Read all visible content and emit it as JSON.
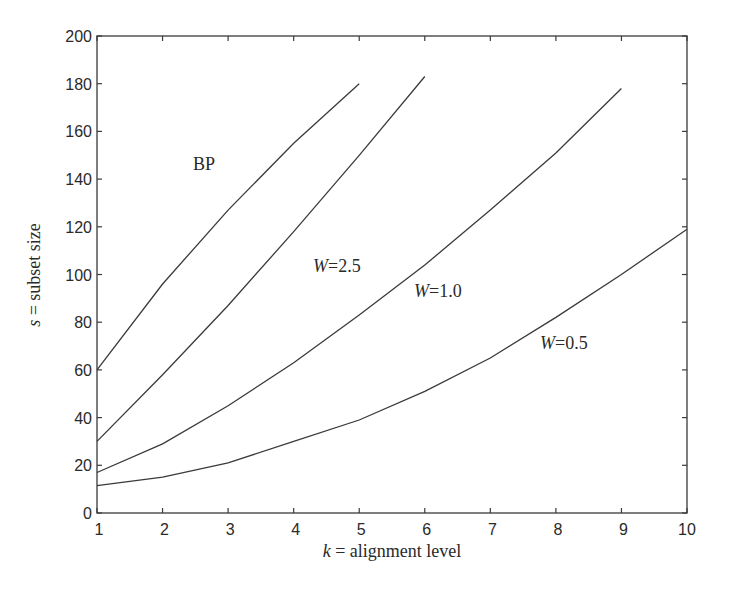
{
  "chart_data": {
    "type": "line",
    "title": "",
    "xlabel_var": "k",
    "xlabel_rest": " = alignment level",
    "xlabel": "k = alignment level",
    "ylabel_var": "s",
    "ylabel_rest": " = subset size",
    "ylabel": "s = subset size",
    "xlim": [
      1,
      10
    ],
    "ylim": [
      0,
      200
    ],
    "xticks": [
      1,
      2,
      3,
      4,
      5,
      6,
      7,
      8,
      9,
      10
    ],
    "yticks": [
      0,
      20,
      40,
      60,
      80,
      100,
      120,
      140,
      160,
      180,
      200
    ],
    "grid": false,
    "legend": "inline labels",
    "series": [
      {
        "name": "BP",
        "label_var": "",
        "label_text": "BP",
        "x": [
          1,
          2,
          3,
          4,
          5
        ],
        "values": [
          60,
          96,
          127,
          155,
          180
        ],
        "label_pos": [
          193,
          170
        ]
      },
      {
        "name": "W=2.5",
        "label_var": "W",
        "label_text": "=2.5",
        "x": [
          1,
          2,
          3,
          4,
          5,
          6
        ],
        "values": [
          30,
          58,
          87,
          118,
          150,
          183
        ],
        "label_pos": [
          313,
          272
        ]
      },
      {
        "name": "W=1.0",
        "label_var": "W",
        "label_text": "=1.0",
        "x": [
          1,
          2,
          3,
          4,
          5,
          6,
          7,
          8,
          9
        ],
        "values": [
          17,
          29,
          45,
          63,
          83,
          104,
          127,
          151,
          178
        ],
        "label_pos": [
          414,
          297
        ]
      },
      {
        "name": "W=0.5",
        "label_var": "W",
        "label_text": "=0.5",
        "x": [
          1,
          2,
          3,
          4,
          5,
          6,
          7,
          8,
          9,
          10
        ],
        "values": [
          11.5,
          15,
          21,
          30,
          39,
          51,
          65,
          82,
          100,
          119
        ],
        "label_pos": [
          540,
          349
        ]
      }
    ]
  }
}
